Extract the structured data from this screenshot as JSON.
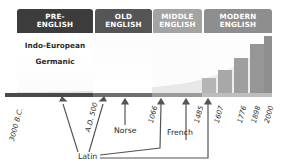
{
  "eras": [
    {
      "id": "pre-english",
      "label": "PRE-\nENGLISH",
      "color": "#3c3c3c"
    },
    {
      "id": "old-english",
      "label": "OLD\nENGLISH",
      "color": "#555555"
    },
    {
      "id": "middle-english",
      "label": "MIDDLE\nENGLISH",
      "color": "#9a9a9a"
    },
    {
      "id": "modern-english",
      "label": "MODERN\nENGLISH",
      "color": "#8c8c8c"
    }
  ],
  "pre_english_languages": [
    "Indo-European",
    "Germanic"
  ],
  "timeline_ticks": [
    "3000 B.C.",
    "A.D. 500",
    "1066",
    "1485",
    "1607",
    "1776",
    "1898",
    "2000"
  ],
  "influences": {
    "latin": "Latin",
    "norse": "Norse",
    "french": "French"
  },
  "colors": {
    "header_dark": "#3c3c3c",
    "header_mid": "#555555",
    "header_light": "#9a9a9a",
    "timeline_bar": "#4a4a4a",
    "arrow": "#555555"
  }
}
